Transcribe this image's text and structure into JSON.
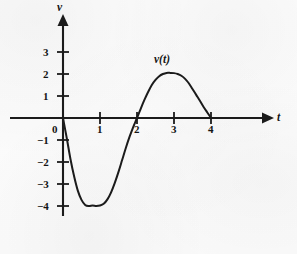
{
  "figure": {
    "background_color": "#fdfdfd",
    "ink_color": "#1b1b1b"
  },
  "labels": {
    "y_axis": "v",
    "x_axis": "t",
    "curve": "v(t)",
    "origin": "0"
  },
  "chart_data": {
    "type": "line",
    "title": "",
    "xlabel": "t",
    "ylabel": "v",
    "curve_label": "v(t)",
    "grid": false,
    "legend": "none",
    "xlim": [
      -0.25,
      5.2
    ],
    "ylim": [
      -4.6,
      3.7
    ],
    "x_ticks": [
      1,
      2,
      3,
      4
    ],
    "x_tick_labels": [
      "1",
      "2",
      "3",
      "4"
    ],
    "y_ticks": [
      -4,
      -3,
      -2,
      -1,
      1,
      2,
      3
    ],
    "y_tick_labels": [
      "−4",
      "−3",
      "−2",
      "−1",
      "1",
      "2",
      "3"
    ],
    "origin_label": "0",
    "zero_crossings": [
      0,
      2,
      4
    ],
    "minimum": {
      "x": 1.05,
      "y": -4.0
    },
    "maximum": {
      "x": 3.05,
      "y": 2.05
    },
    "domain": [
      0,
      4
    ],
    "x": [
      0,
      0.1,
      0.2,
      0.3,
      0.4,
      0.5,
      0.6,
      0.7,
      0.8,
      0.9,
      1.0,
      1.1,
      1.2,
      1.3,
      1.4,
      1.5,
      1.6,
      1.7,
      1.8,
      1.9,
      2.0,
      2.1,
      2.2,
      2.3,
      2.4,
      2.5,
      2.6,
      2.7,
      2.8,
      2.9,
      3.0,
      3.1,
      3.2,
      3.3,
      3.4,
      3.5,
      3.6,
      3.7,
      3.8,
      3.9,
      4.0
    ],
    "y": [
      0.0,
      -0.9,
      -1.85,
      -2.65,
      -3.3,
      -3.72,
      -3.95,
      -4.0,
      -3.98,
      -4.0,
      -3.98,
      -3.9,
      -3.7,
      -3.38,
      -2.95,
      -2.45,
      -1.9,
      -1.35,
      -0.85,
      -0.4,
      0.0,
      0.42,
      0.82,
      1.18,
      1.5,
      1.73,
      1.9,
      2.0,
      2.05,
      2.05,
      2.04,
      2.0,
      1.92,
      1.78,
      1.58,
      1.32,
      1.05,
      0.78,
      0.5,
      0.25,
      0.0
    ]
  },
  "geometry": {
    "origin_px": {
      "x": 63,
      "y": 118
    },
    "unit_x_px": 37,
    "unit_y_px": 22
  }
}
